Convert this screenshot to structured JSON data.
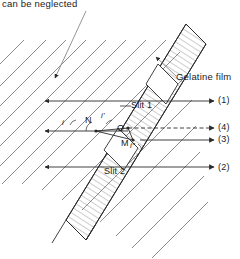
{
  "figure": {
    "title_note": "can be neglected",
    "width": 240,
    "height": 259,
    "background": "#ffffff",
    "ink_color": "#2b2b2b",
    "hatch_color": "#6e6e6e"
  },
  "labels": {
    "note": "can be neglected",
    "gelatine_film": "Gelatine film",
    "slit1": "Slit 1",
    "slit2": "Slit 2",
    "point_N": "N",
    "point_O": "O",
    "point_M": "M",
    "angle_i_upper": "i'",
    "angle_i_lower": "i″",
    "angle_i_left": "i"
  },
  "rays": {
    "ray1": "(1)",
    "ray2": "(2)",
    "ray3": "(3)",
    "ray4": "(4)"
  },
  "geometry": {
    "film_band": {
      "description": "diagonal hatched gelatine film band",
      "angle_deg": -57
    },
    "incident_rays_y": [
      101,
      131,
      167
    ],
    "exit_rays_y": [
      101,
      128,
      140,
      167
    ]
  }
}
